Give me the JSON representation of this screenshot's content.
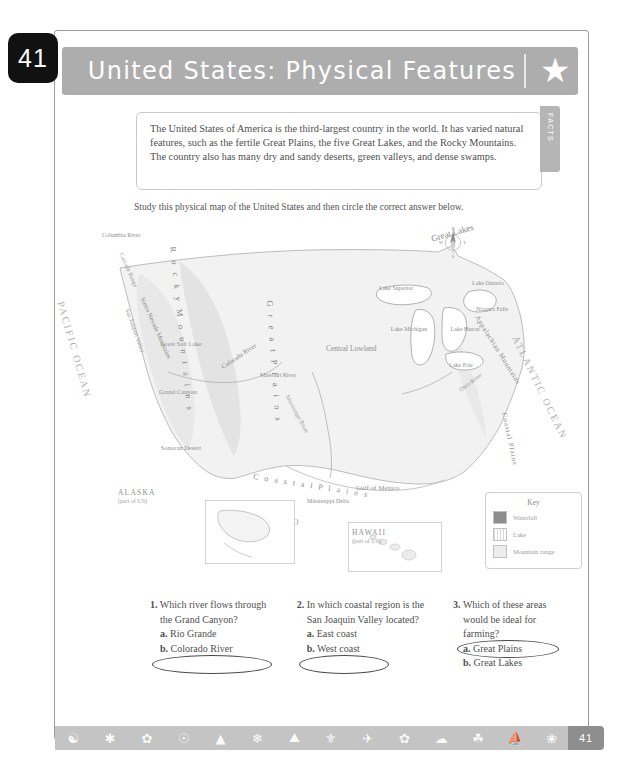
{
  "page_number": "41",
  "header": {
    "title": "United States: Physical Features",
    "star_icon": "star-icon",
    "facts_tab_label": "FACTS"
  },
  "facts": {
    "text": "The United States of America is the third-largest country in the world. It has varied natural features, such as the fertile Great Plains, the five Great Lakes, and the Rocky Mountains. The country also has many dry and sandy deserts, green valleys, and dense swamps."
  },
  "instruction": "Study this physical map of the United States and then circle the correct answer below.",
  "map": {
    "oceans": {
      "pacific": "PACIFIC OCEAN",
      "atlantic": "ATLANTIC OCEAN"
    },
    "neighbor": "MEXICO",
    "features": {
      "rocky": "R o c k y   M o u n t a i n s",
      "great_plains": "G r e a t   P l a i n s",
      "appalachian": "Appalachian Mountains",
      "coastal_plains_east": "Coastal Plains",
      "coastal_plains_south": "C o a s t a l   P l a i n s",
      "central_lowland": "Central Lowland",
      "sierra_nevada": "Sierra Nevada Mountains",
      "san_joaquin": "San Joaquin Valley",
      "cascade": "Cascade Range",
      "great_salt_lake": "Great Salt Lake",
      "grand_canyon": "Grand Canyon",
      "sonoran_desert": "Sonoran Desert",
      "colorado_river": "Colorado River",
      "columbia_river": "Columbia River",
      "missouri_river": "Missouri River",
      "mississippi_river": "Mississippi River",
      "ohio_river": "Ohio River",
      "gulf_of_mexico": "Gulf of Mexico",
      "mississippi_delta": "Mississippi Delta",
      "niagara_falls": "Niagara Falls",
      "great_lakes": "Great Lakes",
      "lake_superior": "Lake Superior",
      "lake_michigan": "Lake Michigan",
      "lake_huron": "Lake Huron",
      "lake_erie": "Lake Erie",
      "lake_ontario": "Lake Ontario"
    },
    "insets": [
      {
        "name": "ALASKA",
        "sub": "(part of US)"
      },
      {
        "name": "HAWAII",
        "sub": "(part of US)"
      }
    ],
    "compass": {
      "n": "N",
      "s": "S",
      "e": "E",
      "w": "W"
    },
    "key": {
      "title": "Key",
      "items": [
        {
          "label": "Waterfall",
          "swatch": "waterfall-swatch"
        },
        {
          "label": "Lake",
          "swatch": "lake-swatch"
        },
        {
          "label": "Mountain range",
          "swatch": "mountain-range-swatch"
        }
      ]
    }
  },
  "questions": [
    {
      "number": "1.",
      "stem": "Which river flows through the Grand Canyon?",
      "options": [
        {
          "letter": "a.",
          "text": "Rio Grande",
          "circled": false
        },
        {
          "letter": "b.",
          "text": "Colorado River",
          "circled": true
        }
      ]
    },
    {
      "number": "2.",
      "stem": "In which coastal region is the San Joaquin Valley located?",
      "options": [
        {
          "letter": "a.",
          "text": "East coast",
          "circled": false
        },
        {
          "letter": "b.",
          "text": "West coast",
          "circled": true
        }
      ]
    },
    {
      "number": "3.",
      "stem": "Which of these areas would be ideal for farming?",
      "options": [
        {
          "letter": "a.",
          "text": "Great Plains",
          "circled": true
        },
        {
          "letter": "b.",
          "text": "Great Lakes",
          "circled": false
        }
      ]
    }
  ],
  "footer": {
    "page_label": "41",
    "icons": [
      "balloon-icon",
      "windmill-icon",
      "flower-icon",
      "compass-icon",
      "tree-icon",
      "snowflake-icon",
      "mountain-icon",
      "globe-icon",
      "bird-icon",
      "leaf-icon",
      "cloud-icon",
      "wheat-icon",
      "tent-icon",
      "feather-icon"
    ]
  },
  "colors": {
    "header_bar": "#adadad",
    "page_tab": "#111112",
    "footer_strip": "#c4c4c4",
    "page_num_box": "#8e8e8e",
    "text": "#4f4f4f"
  }
}
